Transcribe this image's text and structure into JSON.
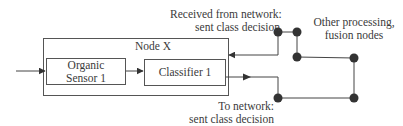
{
  "diagram": {
    "node": {
      "title": "Node X"
    },
    "blocks": [
      {
        "id": "sensor",
        "label_line1": "Organic",
        "label_line2": "Sensor 1"
      },
      {
        "id": "classifier",
        "label": "Classifier 1"
      }
    ],
    "labels": {
      "received_line1": "Received from network:",
      "received_line2": "sent class decision",
      "other_line1": "Other processing,",
      "other_line2": "fusion nodes",
      "sent_line1": "To network:",
      "sent_line2": "sent class decision"
    },
    "network_nodes": [
      {
        "x": 278,
        "y": 32
      },
      {
        "x": 297,
        "y": 32
      },
      {
        "x": 297,
        "y": 57
      },
      {
        "x": 354,
        "y": 58
      },
      {
        "x": 354,
        "y": 98
      },
      {
        "x": 278,
        "y": 98
      }
    ],
    "colors": {
      "stroke": "#444444",
      "node_fill": "#333333"
    }
  }
}
